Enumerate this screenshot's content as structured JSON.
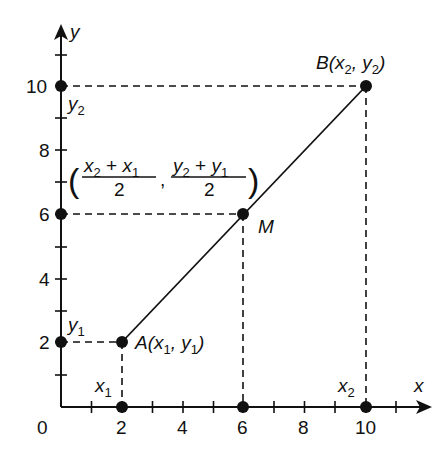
{
  "axes": {
    "x_label": "x",
    "y_label": "y",
    "origin_label": "0",
    "x_ticks": [
      "2",
      "4",
      "6",
      "8",
      "10"
    ],
    "y_ticks": [
      "2",
      "4",
      "6",
      "8",
      "10"
    ]
  },
  "points": {
    "A": {
      "name": "A",
      "label_open": "(x",
      "sub1": "1",
      "comma": ", y",
      "sub2": "1",
      "close": ")",
      "x": 2,
      "y": 2
    },
    "B": {
      "name": "B",
      "label_open": "(x",
      "sub1": "2",
      "comma": ", y",
      "sub2": "2",
      "close": ")",
      "x": 10,
      "y": 10
    },
    "M": {
      "name": "M",
      "x": 6,
      "y": 6
    }
  },
  "projection_labels": {
    "x1": {
      "base": "x",
      "sub": "1"
    },
    "x2": {
      "base": "x",
      "sub": "2"
    },
    "y1": {
      "base": "y",
      "sub": "1"
    },
    "y2": {
      "base": "y",
      "sub": "2"
    }
  },
  "midpoint_formula": {
    "open_paren": "(",
    "close_paren": ")",
    "x_num_a": "x",
    "x_num_a_sub": "2",
    "x_num_plus": " + ",
    "x_num_b": "x",
    "x_num_b_sub": "1",
    "x_den": "2",
    "separator": ",",
    "y_num_a": "y",
    "y_num_a_sub": "2",
    "y_num_plus": " + ",
    "y_num_b": "y",
    "y_num_b_sub": "1",
    "y_den": "2"
  },
  "colors": {
    "ink": "#111111",
    "background": "#ffffff"
  }
}
